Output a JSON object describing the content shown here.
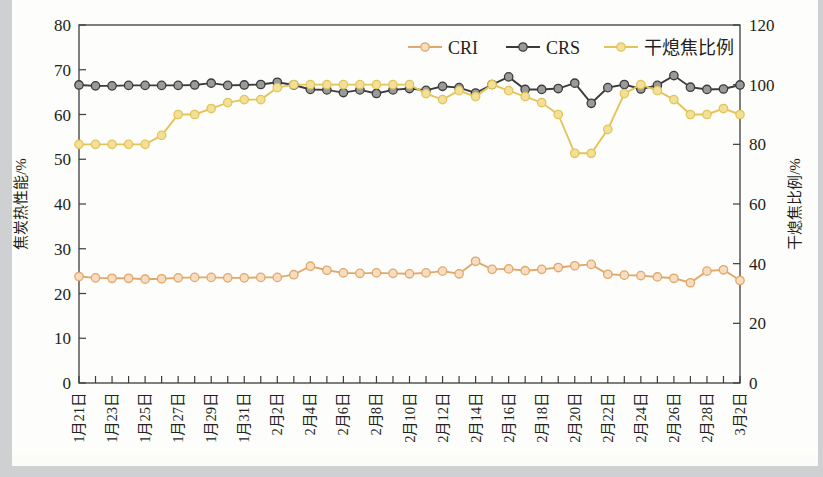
{
  "chart_data": {
    "type": "line",
    "title": "",
    "xlabel": "",
    "ylabel": "焦炭热性能/%",
    "y2label": "干熄焦比例/%",
    "ylim": [
      0,
      80
    ],
    "y2lim": [
      0,
      120
    ],
    "yticks": [
      "0",
      "10",
      "20",
      "30",
      "40",
      "50",
      "60",
      "70",
      "80"
    ],
    "y2ticks": [
      "0",
      "20",
      "40",
      "60",
      "80",
      "100",
      "120"
    ],
    "grid": false,
    "legend_position": "top-center",
    "x": [
      "1月21日",
      "1月22日",
      "1月23日",
      "1月24日",
      "1月25日",
      "1月26日",
      "1月27日",
      "1月28日",
      "1月29日",
      "1月30日",
      "1月31日",
      "2月1日",
      "2月2日",
      "2月3日",
      "2月4日",
      "2月5日",
      "2月6日",
      "2月7日",
      "2月8日",
      "2月9日",
      "2月10日",
      "2月11日",
      "2月12日",
      "2月13日",
      "2月14日",
      "2月15日",
      "2月16日",
      "2月17日",
      "2月18日",
      "2月19日",
      "2月20日",
      "2月21日",
      "2月22日",
      "2月23日",
      "2月24日",
      "2月25日",
      "2月26日",
      "2月27日",
      "2月28日",
      "3月1日",
      "3月2日"
    ],
    "xtick_labels": [
      "1月21日",
      "1月23日",
      "1月25日",
      "1月27日",
      "1月29日",
      "1月31日",
      "2月2日",
      "2月4日",
      "2月6日",
      "2月8日",
      "2月10日",
      "2月12日",
      "2月14日",
      "2月16日",
      "2月18日",
      "2月20日",
      "2月22日",
      "2月24日",
      "2月26日",
      "2月28日",
      "3月2日"
    ],
    "series": [
      {
        "name": "CRI",
        "axis": "left",
        "color": "#e0a86a",
        "marker_fill": "#f6dcc0",
        "values": [
          23.8,
          23.5,
          23.4,
          23.4,
          23.2,
          23.3,
          23.5,
          23.6,
          23.6,
          23.5,
          23.5,
          23.6,
          23.6,
          24.2,
          26.1,
          25.2,
          24.6,
          24.5,
          24.6,
          24.5,
          24.4,
          24.6,
          25.0,
          24.4,
          27.2,
          25.4,
          25.5,
          25.1,
          25.4,
          25.8,
          26.2,
          26.5,
          24.3,
          24.1,
          24.0,
          23.7,
          23.4,
          22.4,
          25.0,
          25.3,
          22.9
        ]
      },
      {
        "name": "CRS",
        "axis": "left",
        "color": "#3b3b3b",
        "marker_fill": "#9a9a9a",
        "values": [
          66.6,
          66.4,
          66.4,
          66.5,
          66.5,
          66.5,
          66.5,
          66.6,
          67.0,
          66.5,
          66.6,
          66.7,
          67.2,
          66.6,
          65.6,
          65.5,
          64.9,
          65.5,
          64.7,
          65.5,
          65.8,
          65.4,
          66.3,
          66.0,
          64.8,
          66.7,
          68.4,
          65.6,
          65.6,
          65.8,
          67.0,
          62.5,
          66.0,
          66.7,
          65.7,
          66.5,
          68.7,
          66.1,
          65.6,
          65.7,
          66.6
        ]
      },
      {
        "name": "干熄焦比例",
        "axis": "right",
        "color": "#e3c45a",
        "marker_fill": "#f2e096",
        "values": [
          80,
          80,
          80,
          80,
          80,
          83,
          90,
          90,
          92,
          94,
          95,
          95,
          99,
          100,
          100,
          100,
          100,
          100,
          100,
          100,
          100,
          97,
          95,
          98,
          96,
          100,
          98,
          96,
          94,
          90,
          77,
          77,
          85,
          97,
          100,
          98,
          95,
          90,
          90,
          92,
          90
        ]
      }
    ]
  },
  "legend": {
    "items": [
      {
        "label": "CRI"
      },
      {
        "label": "CRS"
      },
      {
        "label": "干熄焦比例"
      }
    ]
  }
}
